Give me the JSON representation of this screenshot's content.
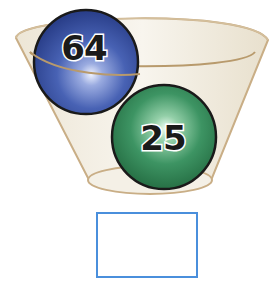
{
  "figure": {
    "container": "bowl-icon",
    "balls": [
      {
        "label": "64",
        "color": "#3f5fb0",
        "highlight": "#dfe6ff"
      },
      {
        "label": "25",
        "color": "#2f8a55",
        "highlight": "#e4f7ea"
      }
    ],
    "answer_box": {
      "value": "",
      "border_color": "#4a8fdc"
    }
  }
}
